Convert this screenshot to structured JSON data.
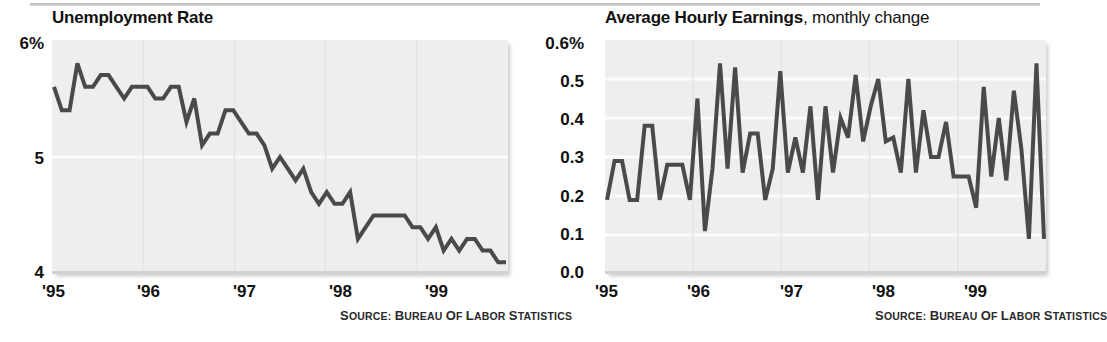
{
  "figure": {
    "source_note": "SOURCE: BUREAU OF LABOR STATISTICS"
  },
  "charts": [
    {
      "id": "unemployment-rate",
      "title_main": "Unemployment Rate",
      "title_sub": "",
      "y_ticks": [
        "6%",
        "5",
        "4"
      ],
      "x_ticks": [
        "'95",
        "'96",
        "'97",
        "'98",
        "'99"
      ]
    },
    {
      "id": "average-hourly-earnings",
      "title_main": "Average Hourly Earnings",
      "title_sub": ", monthly change",
      "y_ticks": [
        "0.6%",
        "0.5",
        "0.4",
        "0.3",
        "0.2",
        "0.1",
        "0.0"
      ],
      "x_ticks": [
        "'95",
        "'96",
        "'97",
        "'98",
        "'99"
      ]
    }
  ],
  "chart_data": [
    {
      "type": "line",
      "title": "Unemployment Rate",
      "xlabel": "",
      "ylabel": "",
      "ylim": [
        4,
        6
      ],
      "ytick_values": [
        6,
        5,
        4
      ],
      "ytick_labels": [
        "6%",
        "5",
        "4"
      ],
      "xtick_labels": [
        "'95",
        "'96",
        "'97",
        "'98",
        "'99"
      ],
      "xtick_positions": [
        0,
        12,
        24,
        36,
        48
      ],
      "grid": true,
      "legend": "none",
      "line_color": "#4a4a4a",
      "plot_background": "#eeeeee",
      "x": [
        "1995-01",
        "1995-02",
        "1995-03",
        "1995-04",
        "1995-05",
        "1995-06",
        "1995-07",
        "1995-08",
        "1995-09",
        "1995-10",
        "1995-11",
        "1995-12",
        "1996-01",
        "1996-02",
        "1996-03",
        "1996-04",
        "1996-05",
        "1996-06",
        "1996-07",
        "1996-08",
        "1996-09",
        "1996-10",
        "1996-11",
        "1996-12",
        "1997-01",
        "1997-02",
        "1997-03",
        "1997-04",
        "1997-05",
        "1997-06",
        "1997-07",
        "1997-08",
        "1997-09",
        "1997-10",
        "1997-11",
        "1997-12",
        "1998-01",
        "1998-02",
        "1998-03",
        "1998-04",
        "1998-05",
        "1998-06",
        "1998-07",
        "1998-08",
        "1998-09",
        "1998-10",
        "1998-11",
        "1998-12",
        "1999-01",
        "1999-02",
        "1999-03",
        "1999-04",
        "1999-05",
        "1999-06",
        "1999-07",
        "1999-08",
        "1999-09",
        "1999-10",
        "1999-11"
      ],
      "values": [
        5.6,
        5.4,
        5.4,
        5.8,
        5.6,
        5.6,
        5.7,
        5.7,
        5.6,
        5.5,
        5.6,
        5.6,
        5.6,
        5.5,
        5.5,
        5.6,
        5.6,
        5.3,
        5.5,
        5.1,
        5.2,
        5.2,
        5.4,
        5.4,
        5.3,
        5.2,
        5.2,
        5.1,
        4.9,
        5.0,
        4.9,
        4.8,
        4.9,
        4.7,
        4.6,
        4.7,
        4.6,
        4.6,
        4.7,
        4.3,
        4.4,
        4.5,
        4.5,
        4.5,
        4.5,
        4.5,
        4.4,
        4.4,
        4.3,
        4.4,
        4.2,
        4.3,
        4.2,
        4.3,
        4.3,
        4.2,
        4.2,
        4.1,
        4.1
      ]
    },
    {
      "type": "line",
      "title": "Average Hourly Earnings, monthly change",
      "xlabel": "",
      "ylabel": "",
      "ylim": [
        0.0,
        0.6
      ],
      "ytick_values": [
        0.6,
        0.5,
        0.4,
        0.3,
        0.2,
        0.1,
        0.0
      ],
      "ytick_labels": [
        "0.6%",
        "0.5",
        "0.4",
        "0.3",
        "0.2",
        "0.1",
        "0.0"
      ],
      "xtick_labels": [
        "'95",
        "'96",
        "'97",
        "'98",
        "'99"
      ],
      "xtick_positions": [
        0,
        12,
        24,
        36,
        48
      ],
      "grid": true,
      "legend": "none",
      "line_color": "#4a4a4a",
      "plot_background": "#eeeeee",
      "x": [
        "1995-01",
        "1995-02",
        "1995-03",
        "1995-04",
        "1995-05",
        "1995-06",
        "1995-07",
        "1995-08",
        "1995-09",
        "1995-10",
        "1995-11",
        "1995-12",
        "1996-01",
        "1996-02",
        "1996-03",
        "1996-04",
        "1996-05",
        "1996-06",
        "1996-07",
        "1996-08",
        "1996-09",
        "1996-10",
        "1996-11",
        "1996-12",
        "1997-01",
        "1997-02",
        "1997-03",
        "1997-04",
        "1997-05",
        "1997-06",
        "1997-07",
        "1997-08",
        "1997-09",
        "1997-10",
        "1997-11",
        "1997-12",
        "1998-01",
        "1998-02",
        "1998-03",
        "1998-04",
        "1998-05",
        "1998-06",
        "1998-07",
        "1998-08",
        "1998-09",
        "1998-10",
        "1998-11",
        "1998-12",
        "1999-01",
        "1999-02",
        "1999-03",
        "1999-04",
        "1999-05",
        "1999-06",
        "1999-07",
        "1999-08",
        "1999-09",
        "1999-10",
        "1999-11"
      ],
      "values": [
        0.19,
        0.29,
        0.29,
        0.19,
        0.19,
        0.38,
        0.38,
        0.19,
        0.28,
        0.28,
        0.28,
        0.19,
        0.45,
        0.11,
        0.27,
        0.54,
        0.27,
        0.53,
        0.26,
        0.36,
        0.36,
        0.19,
        0.27,
        0.52,
        0.26,
        0.35,
        0.26,
        0.43,
        0.19,
        0.43,
        0.26,
        0.4,
        0.35,
        0.51,
        0.34,
        0.43,
        0.5,
        0.34,
        0.35,
        0.26,
        0.5,
        0.26,
        0.42,
        0.3,
        0.3,
        0.39,
        0.25,
        0.25,
        0.25,
        0.17,
        0.48,
        0.25,
        0.4,
        0.24,
        0.47,
        0.32,
        0.09,
        0.54,
        0.09
      ]
    }
  ]
}
